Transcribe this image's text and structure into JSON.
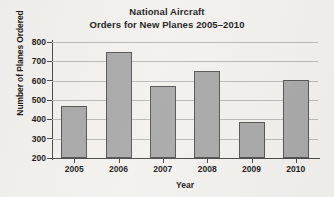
{
  "chart_data": {
    "type": "bar",
    "title": "National Aircraft Orders for New Planes 2005–2010",
    "title_lines": [
      "National Aircraft",
      "Orders for New Planes 2005–2010"
    ],
    "xlabel": "Year",
    "ylabel": "Number of Planes Ordered",
    "categories": [
      "2005",
      "2006",
      "2007",
      "2008",
      "2009",
      "2010"
    ],
    "values": [
      470,
      750,
      570,
      650,
      385,
      605
    ],
    "ylim": [
      200,
      800
    ],
    "ytick_labels": [
      "800",
      "700",
      "600",
      "500",
      "400",
      "300",
      "200"
    ],
    "ytick_values": [
      800,
      700,
      600,
      500,
      400,
      300,
      200
    ],
    "ystep": 100,
    "grid": true,
    "legend": false,
    "bar_color": "#a9a9a9",
    "bar_border_color": "#555555",
    "gridline_color": "#b9b9b9",
    "axis_color": "#4a4a4a",
    "background_color": "#f2f1ee"
  }
}
